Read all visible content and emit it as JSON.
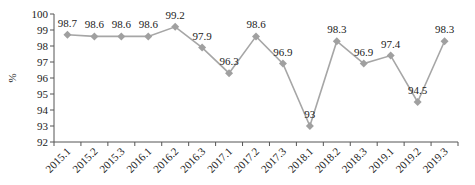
{
  "chart_data": {
    "type": "line",
    "title": "",
    "xlabel": "",
    "ylabel": "%",
    "ylim": [
      92,
      100
    ],
    "yticks": [
      92,
      93,
      94,
      95,
      96,
      97,
      98,
      99,
      100
    ],
    "grid": false,
    "legend": null,
    "categories": [
      "2015.1",
      "2015.2",
      "2015.3",
      "2016.1",
      "2016.2",
      "2016.3",
      "2017.1",
      "2017.2",
      "2017.3",
      "2018.1",
      "2018.2",
      "2018.3",
      "2019.1",
      "2019.2",
      "2019.3"
    ],
    "series": [
      {
        "name": "",
        "color": "#a6a6a6",
        "marker": "diamond",
        "values": [
          98.7,
          98.6,
          98.6,
          98.6,
          99.2,
          97.9,
          96.3,
          98.6,
          96.9,
          93,
          98.3,
          96.9,
          97.4,
          94.5,
          98.3
        ],
        "labels": [
          "98.7",
          "98.6",
          "98.6",
          "98.6",
          "99.2",
          "97.9",
          "96.3",
          "98.6",
          "96.9",
          "93",
          "98.3",
          "96.9",
          "97.4",
          "94.5",
          "98.3"
        ]
      }
    ]
  }
}
